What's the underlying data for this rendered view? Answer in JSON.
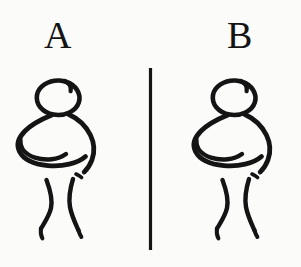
{
  "image": {
    "kind": "hand-drawn-line-diagram",
    "background_color": "#fbfbfa",
    "ink_color": "#141414",
    "width": 301,
    "height": 267,
    "description": "Two identical hand-drawn stick figures of a standing person, labelled A on the left and B on the right, separated by a vertical rule."
  },
  "labels": {
    "left": "A",
    "right": "B"
  },
  "panels": [
    {
      "id": "panel-a",
      "label": "A",
      "figure": {
        "name": "stick-figure",
        "parts": [
          "head",
          "torso",
          "arm",
          "left-leg",
          "right-leg",
          "left-foot",
          "right-foot"
        ]
      }
    },
    {
      "id": "panel-b",
      "label": "B",
      "figure": {
        "name": "stick-figure",
        "parts": [
          "head",
          "torso",
          "arm",
          "left-leg",
          "right-leg",
          "left-foot",
          "right-foot"
        ]
      }
    }
  ],
  "divider": {
    "name": "vertical-divider",
    "orientation": "vertical",
    "color": "#141414",
    "x": 150,
    "y_top": 68,
    "y_bottom": 250,
    "thickness": 3
  }
}
